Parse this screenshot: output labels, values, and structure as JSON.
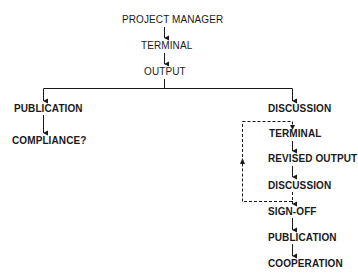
{
  "diagram": {
    "type": "flowchart",
    "root": {
      "nodes": [
        {
          "id": "project-manager",
          "label": "PROJECT MANAGER"
        },
        {
          "id": "terminal",
          "label": "TERMINAL"
        },
        {
          "id": "output",
          "label": "OUTPUT"
        }
      ]
    },
    "left_branch": {
      "nodes": [
        {
          "id": "publication",
          "label": "PUBLICATION"
        },
        {
          "id": "compliance",
          "label": "COMPLIANCE?"
        }
      ]
    },
    "right_branch": {
      "nodes": [
        {
          "id": "discussion-1",
          "label": "DISCUSSION"
        },
        {
          "id": "terminal-2",
          "label": "TERMINAL"
        },
        {
          "id": "revised-output",
          "label": "REVISED OUTPUT"
        },
        {
          "id": "discussion-2",
          "label": "DISCUSSION"
        },
        {
          "id": "sign-off",
          "label": "SIGN-OFF"
        },
        {
          "id": "publication-2",
          "label": "PUBLICATION"
        },
        {
          "id": "cooperation",
          "label": "COOPERATION"
        }
      ],
      "feedback_loop": {
        "from": "discussion-2",
        "to": "terminal-2",
        "style": "dashed"
      }
    },
    "colors": {
      "line": "#1a1a1a",
      "text": "#1a1a1a",
      "background": "#ffffff"
    }
  }
}
